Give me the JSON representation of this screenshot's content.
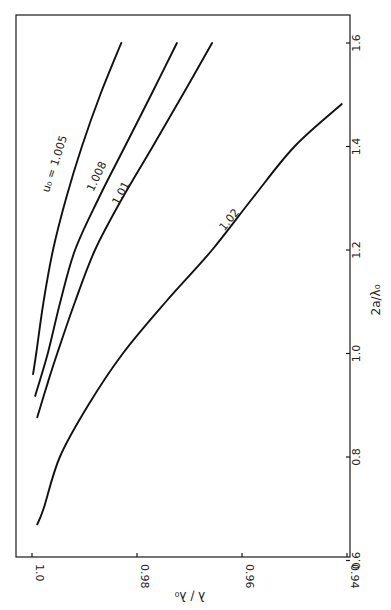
{
  "chart_data": {
    "type": "line",
    "orientation": "rotated-90-clockwise",
    "title": "",
    "xlabel": "2a/λ₀",
    "ylabel": "λ / λ₀",
    "xlim": [
      0.6,
      1.65
    ],
    "ylim": [
      0.94,
      1.0
    ],
    "x_ticks": [
      "0.6",
      "0.8",
      "1.0",
      "1.2",
      "1.4",
      "1.6"
    ],
    "y_ticks": [
      "1.0",
      "0.98",
      "0.96",
      "0.94"
    ],
    "grid": false,
    "legend": "none (curves labeled inline)",
    "series": [
      {
        "name": "u₀ = 1.005",
        "label": "u₀ = 1.005",
        "x": [
          0.96,
          1.0,
          1.1,
          1.2,
          1.3,
          1.4,
          1.5,
          1.6
        ],
        "y": [
          0.9998,
          0.9992,
          0.9978,
          0.996,
          0.9935,
          0.9905,
          0.987,
          0.983
        ]
      },
      {
        "name": "1.008",
        "label": "1.008",
        "x": [
          0.918,
          1.0,
          1.1,
          1.2,
          1.3,
          1.4,
          1.5,
          1.6
        ],
        "y": [
          0.9994,
          0.997,
          0.9946,
          0.9918,
          0.9873,
          0.9823,
          0.9773,
          0.9724
        ]
      },
      {
        "name": "1.01",
        "label": "1.01",
        "x": [
          0.877,
          0.95,
          1.0,
          1.1,
          1.2,
          1.3,
          1.4,
          1.5,
          1.6
        ],
        "y": [
          0.999,
          0.9968,
          0.9952,
          0.9918,
          0.988,
          0.9828,
          0.977,
          0.9713,
          0.9657
        ]
      },
      {
        "name": "1.02",
        "label": "1.02",
        "x": [
          0.67,
          0.7,
          0.8,
          0.9,
          1.0,
          1.1,
          1.2,
          1.3,
          1.4,
          1.482
        ],
        "y": [
          0.999,
          0.9978,
          0.9947,
          0.9893,
          0.9827,
          0.9745,
          0.9657,
          0.958,
          0.95,
          0.941
        ]
      }
    ]
  },
  "figure": {
    "caption_faint": "FIGURE"
  }
}
